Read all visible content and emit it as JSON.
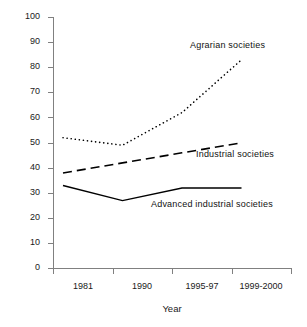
{
  "chart_data": {
    "type": "line",
    "title": "",
    "xlabel": "Year",
    "ylabel": "",
    "categories": [
      "1981",
      "1990",
      "1995-97",
      "1999-2000"
    ],
    "ylim": [
      0,
      100
    ],
    "yticks": [
      0,
      10,
      20,
      30,
      40,
      50,
      60,
      70,
      80,
      90,
      100
    ],
    "grid": false,
    "legend_position": "inline-annotations",
    "series": [
      {
        "name": "Agrarian societies",
        "style": "dotted",
        "color": "#000000",
        "values": [
          52,
          49,
          62,
          83
        ]
      },
      {
        "name": "Industrial societies",
        "style": "dashed",
        "color": "#000000",
        "values": [
          38,
          42,
          46,
          50
        ]
      },
      {
        "name": "Advanced industrial societies",
        "style": "solid",
        "color": "#000000",
        "values": [
          33,
          27,
          32,
          32
        ]
      }
    ],
    "annotations": [
      {
        "text": "Agrarian societies",
        "x_px": 190,
        "y_px": 46
      },
      {
        "text": "Industrial societies",
        "x_px": 196,
        "y_px": 155
      },
      {
        "text": "Advanced industrial societies",
        "x_px": 151,
        "y_px": 205
      }
    ]
  },
  "axis": {
    "y_labels": [
      "100",
      "90",
      "80",
      "70",
      "60",
      "50",
      "40",
      "30",
      "20",
      "10",
      "0"
    ],
    "x_labels": [
      "1981",
      "1990",
      "1995-97",
      "1999-2000"
    ],
    "x_title": "Year"
  }
}
